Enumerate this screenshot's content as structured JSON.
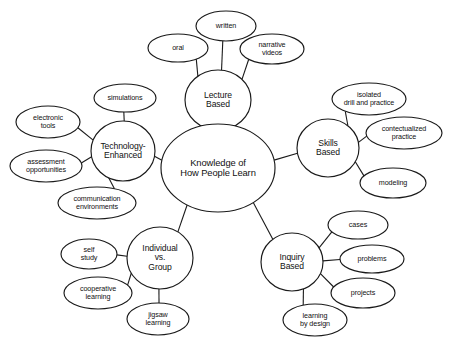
{
  "diagram": {
    "background_color": "#ffffff",
    "stroke_color": "#1a1a1a",
    "text_color": "#111111"
  },
  "central": {
    "label": "Knowledge of\nHow People Learn",
    "cx": 218,
    "cy": 168,
    "rx": 57,
    "ry": 44
  },
  "branches": [
    {
      "id": "lecture-based",
      "label": "Lecture\nBased",
      "cx": 218,
      "cy": 100,
      "rx": 33,
      "ry": 30,
      "leaves": [
        {
          "id": "written",
          "label": "written",
          "cx": 226,
          "cy": 26,
          "rx": 30,
          "ry": 15
        },
        {
          "id": "oral",
          "label": "oral",
          "cx": 178,
          "cy": 48,
          "rx": 30,
          "ry": 14
        },
        {
          "id": "narrative-videos",
          "label": "narrative\nvideos",
          "cx": 272,
          "cy": 49,
          "rx": 32,
          "ry": 15
        }
      ]
    },
    {
      "id": "technology-enhanced",
      "label": "Technology-\nEnhanced",
      "cx": 123,
      "cy": 151,
      "rx": 32,
      "ry": 30,
      "leaves": [
        {
          "id": "simulations",
          "label": "simulations",
          "cx": 125,
          "cy": 98,
          "rx": 31,
          "ry": 14
        },
        {
          "id": "electronic-tools",
          "label": "electronic\ntools",
          "cx": 48,
          "cy": 122,
          "rx": 32,
          "ry": 16
        },
        {
          "id": "assessment-opportunities",
          "label": "assessment\nopportunities",
          "cx": 46,
          "cy": 166,
          "rx": 36,
          "ry": 16
        },
        {
          "id": "communication-environments",
          "label": "communication\nenvironments",
          "cx": 97,
          "cy": 203,
          "rx": 39,
          "ry": 16
        }
      ]
    },
    {
      "id": "skills-based",
      "label": "Skills\nBased",
      "cx": 328,
      "cy": 148,
      "rx": 31,
      "ry": 29,
      "leaves": [
        {
          "id": "isolated-drill-and-practice",
          "label": "isolated\ndrill and practice",
          "cx": 369,
          "cy": 99,
          "rx": 37,
          "ry": 16
        },
        {
          "id": "contectualized-practice",
          "label": "contectualized\npractice",
          "cx": 404,
          "cy": 133,
          "rx": 38,
          "ry": 16
        },
        {
          "id": "modeling",
          "label": "modeling",
          "cx": 393,
          "cy": 183,
          "rx": 33,
          "ry": 15
        }
      ]
    },
    {
      "id": "individual-vs-group",
      "label": "Individual\nvs.\nGroup",
      "cx": 160,
      "cy": 258,
      "rx": 33,
      "ry": 31,
      "leaves": [
        {
          "id": "self-study",
          "label": "self\nstudy",
          "cx": 89,
          "cy": 254,
          "rx": 28,
          "ry": 15
        },
        {
          "id": "cooperative-learning",
          "label": "cooperative\nlearning",
          "cx": 98,
          "cy": 293,
          "rx": 34,
          "ry": 16
        },
        {
          "id": "jigsaw-learning",
          "label": "jigsaw\nlearning",
          "cx": 158,
          "cy": 319,
          "rx": 31,
          "ry": 16
        }
      ]
    },
    {
      "id": "inquiry-based",
      "label": "Inquiry\nBased",
      "cx": 292,
      "cy": 262,
      "rx": 31,
      "ry": 29,
      "leaves": [
        {
          "id": "cases",
          "label": "cases",
          "cx": 358,
          "cy": 225,
          "rx": 30,
          "ry": 14
        },
        {
          "id": "problems",
          "label": "problems",
          "cx": 372,
          "cy": 259,
          "rx": 32,
          "ry": 14
        },
        {
          "id": "projects",
          "label": "projects",
          "cx": 363,
          "cy": 293,
          "rx": 32,
          "ry": 15
        },
        {
          "id": "learning-by-design",
          "label": "learning\nby design",
          "cx": 315,
          "cy": 320,
          "rx": 32,
          "ry": 16
        }
      ]
    }
  ],
  "footer": {
    "text": "clipped caption text"
  }
}
